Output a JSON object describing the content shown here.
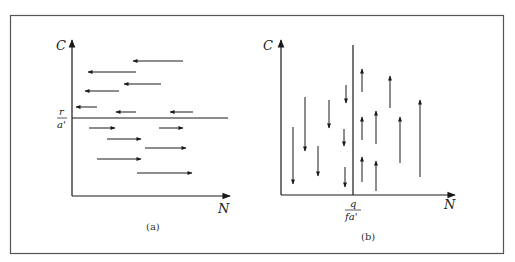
{
  "figure": {
    "panels": [
      {
        "id": "a",
        "caption": "(a)",
        "y_axis_label": "C",
        "x_axis_label": "N",
        "threshold_axis": "C",
        "threshold_label_numerator": "r",
        "threshold_label_denominator": "a'",
        "description": "Horizontal arrows: above C = r/a' they point left (N decreases); below they point right (N increases).",
        "arrows_above": 7,
        "arrows_below": 6
      },
      {
        "id": "b",
        "caption": "(b)",
        "y_axis_label": "C",
        "x_axis_label": "N",
        "threshold_axis": "N",
        "threshold_label_numerator": "q",
        "threshold_label_denominator": "fa'",
        "description": "Vertical arrows: left of N = q/fa' they point down (C decreases); right they point up (C increases).",
        "arrows_left": 7,
        "arrows_right": 8
      }
    ],
    "colors": {
      "ink": "#1a1a1a",
      "frame": "#555555",
      "background": "#ffffff"
    }
  }
}
